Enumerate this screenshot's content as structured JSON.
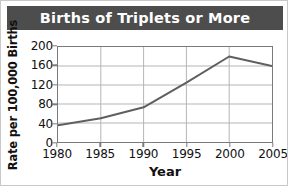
{
  "chart_data": {
    "type": "line",
    "title": "Births of Triplets or More",
    "xlabel": "Year",
    "ylabel": "Rate per 100,000 Births",
    "x": [
      1980,
      1985,
      1990,
      1995,
      2000,
      2005
    ],
    "values": [
      35,
      50,
      73,
      125,
      180,
      160
    ],
    "xticklabels": [
      "1980",
      "1985",
      "1990",
      "1995",
      "2000",
      "2005"
    ],
    "yticklabels": [
      "0",
      "40",
      "80",
      "120",
      "160",
      "200"
    ],
    "yticks": [
      0,
      40,
      80,
      120,
      160,
      200
    ],
    "xlim": [
      1980,
      2005
    ],
    "ylim": [
      0,
      200
    ],
    "grid": true,
    "legend": "none",
    "series_color": "#5f5f5f",
    "title_band_color": "#4d4d4d",
    "title_text_color": "#ffffff",
    "grid_color": "#b4b4b4",
    "frame_color": "#7a7a7a",
    "background_color": "#ffffff"
  }
}
